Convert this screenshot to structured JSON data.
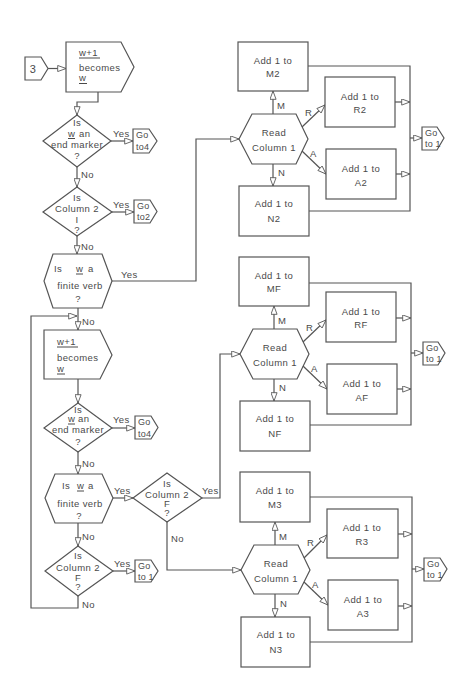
{
  "colors": {
    "background": "#ffffff",
    "line": "#555555",
    "text": "#4a4a4a"
  },
  "diagram": {
    "entry": {
      "label": "3"
    },
    "assign_1": {
      "line1": "w+1",
      "line2": "becomes",
      "line3": "w"
    },
    "end_marker_1": {
      "line1": "Is",
      "line2_var": "w",
      "line2_rest": "an",
      "line3": "end marker",
      "line4": "?",
      "yes_label": "Yes",
      "no_label": "No",
      "goto": {
        "line1": "Go",
        "line2": "to4"
      }
    },
    "column2_I": {
      "line1": "Is",
      "line2": "Column 2",
      "line3": "I",
      "line4": "?",
      "yes_label": "Yes",
      "no_label": "No",
      "goto": {
        "line1": "Go",
        "line2": "to2"
      }
    },
    "finite_verb_1": {
      "line1_is": "Is",
      "line1_var": "w",
      "line1_rest": "a",
      "line2": "finite verb",
      "line3": "?",
      "yes_label": "Yes",
      "no_label": "No"
    },
    "assign_2": {
      "line1": "w+1",
      "line2": "becomes",
      "line3": "w"
    },
    "end_marker_2": {
      "line1": "Is",
      "line2_var": "w",
      "line2_rest": "an",
      "line3": "end marker",
      "line4": "?",
      "yes_label": "Yes",
      "no_label": "No",
      "goto": {
        "line1": "Go",
        "line2": "to4"
      }
    },
    "finite_verb_2": {
      "line1_is": "Is",
      "line1_var": "w",
      "line1_rest": "a",
      "line2": "finite verb",
      "line3": "?",
      "yes_label": "Yes",
      "no_label": "No"
    },
    "column2_F_branch": {
      "line1": "Is",
      "line2": "Column 2",
      "line3": "F",
      "line4": "?",
      "yes_label": "Yes",
      "no_label": "No"
    },
    "column2_F_loop": {
      "line1": "Is",
      "line2": "Column 2",
      "line3": "F",
      "line4": "?",
      "yes_label": "Yes",
      "no_label": "No",
      "goto": {
        "line1": "Go",
        "line2": "to 1"
      }
    }
  },
  "read_sections": [
    {
      "read": {
        "line1": "Read",
        "line2": "Column 1"
      },
      "branch_labels": {
        "m": "M",
        "r": "R",
        "a": "A",
        "n": "N"
      },
      "boxes": {
        "m": {
          "line1": "Add 1 to",
          "line2": "M2"
        },
        "r": {
          "line1": "Add 1 to",
          "line2": "R2"
        },
        "a": {
          "line1": "Add 1 to",
          "line2": "A2"
        },
        "n": {
          "line1": "Add 1 to",
          "line2": "N2"
        }
      },
      "goto": {
        "line1": "Go",
        "line2": "to 1"
      }
    },
    {
      "read": {
        "line1": "Read",
        "line2": "Column 1"
      },
      "branch_labels": {
        "m": "M",
        "r": "R",
        "a": "A",
        "n": "N"
      },
      "boxes": {
        "m": {
          "line1": "Add 1 to",
          "line2": "MF"
        },
        "r": {
          "line1": "Add 1 to",
          "line2": "RF"
        },
        "a": {
          "line1": "Add 1 to",
          "line2": "AF"
        },
        "n": {
          "line1": "Add 1 to",
          "line2": "NF"
        }
      },
      "goto": {
        "line1": "Go",
        "line2": "to 1"
      }
    },
    {
      "read": {
        "line1": "Read",
        "line2": "Column 1"
      },
      "branch_labels": {
        "m": "M",
        "r": "R",
        "a": "A",
        "n": "N"
      },
      "boxes": {
        "m": {
          "line1": "Add 1 to",
          "line2": "M3"
        },
        "r": {
          "line1": "Add 1 to",
          "line2": "R3"
        },
        "a": {
          "line1": "Add 1 to",
          "line2": "A3"
        },
        "n": {
          "line1": "Add 1 to",
          "line2": "N3"
        }
      },
      "goto": {
        "line1": "Go",
        "line2": "to 1"
      }
    }
  ]
}
